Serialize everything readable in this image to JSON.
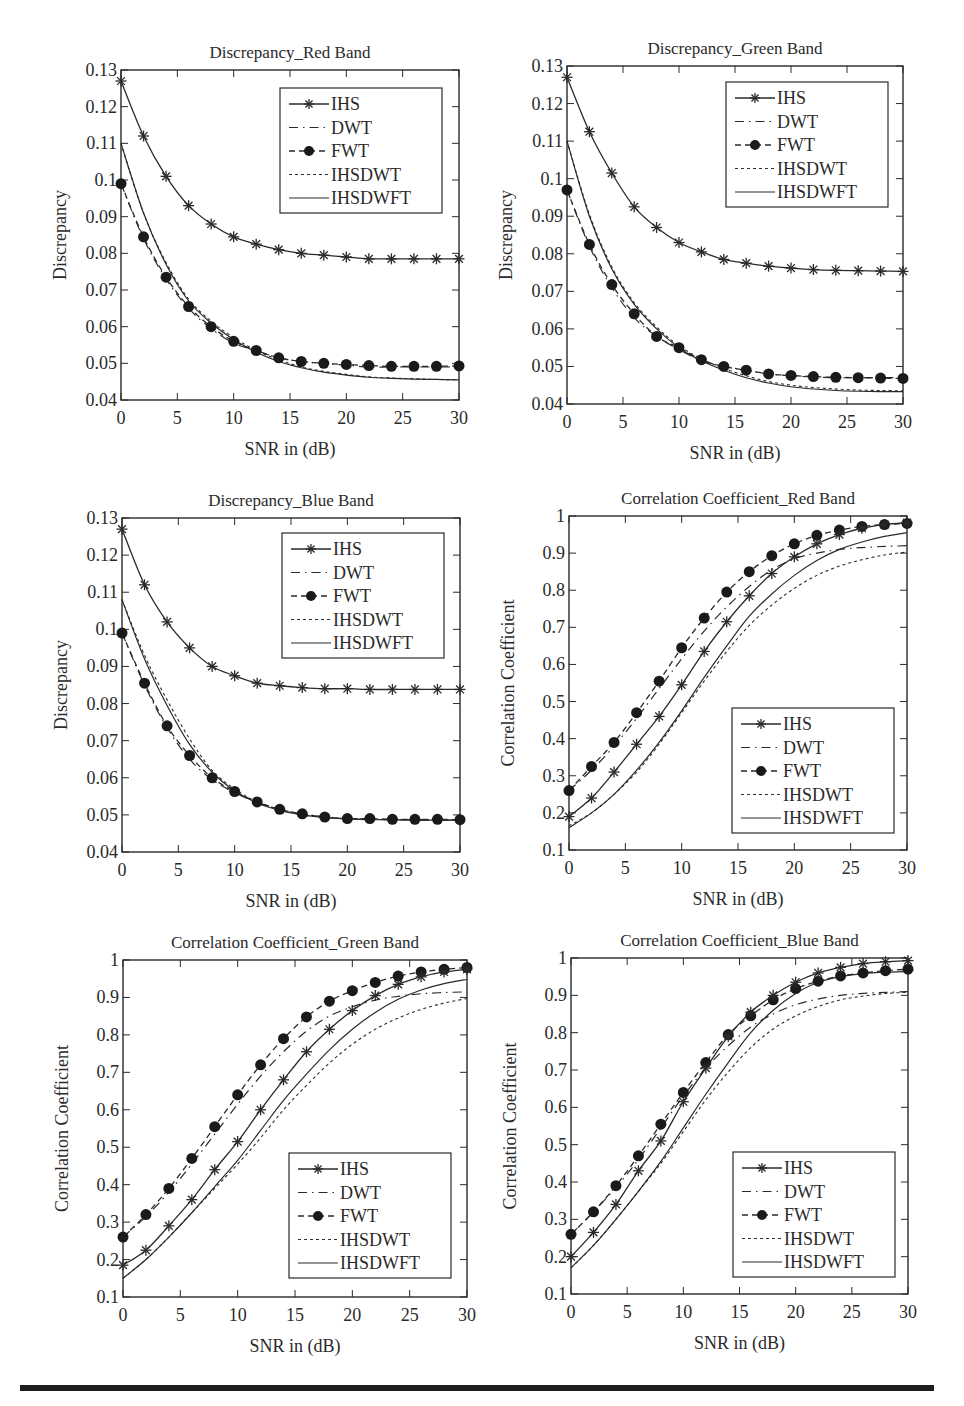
{
  "figure": {
    "layout": "3 rows x 2 columns",
    "bottom_rule": true
  },
  "legend_entries": [
    {
      "name": "IHS",
      "line": "solid",
      "marker": "asterisk"
    },
    {
      "name": "DWT",
      "line": "dash-dot long",
      "marker": "none"
    },
    {
      "name": "FWT",
      "line": "dashed",
      "marker": "filled-circle"
    },
    {
      "name": "IHSDWT",
      "line": "dotted short-dash",
      "marker": "none"
    },
    {
      "name": "IHSDWFT",
      "line": "solid",
      "marker": "none"
    }
  ],
  "chart_data": [
    {
      "id": "disc_red",
      "type": "line",
      "title": "Discrepancy_Red Band",
      "xlabel": "SNR in (dB)",
      "ylabel": "Discrepancy",
      "xlim": [
        0,
        30
      ],
      "ylim": [
        0.04,
        0.13
      ],
      "xticks": [
        0,
        5,
        10,
        15,
        20,
        25,
        30
      ],
      "yticks": [
        0.04,
        0.05,
        0.06,
        0.07,
        0.08,
        0.09,
        0.1,
        0.11,
        0.12,
        0.13
      ],
      "ytick_labels": [
        "0.04",
        "0.05",
        "0.06",
        "0.07",
        "0.08",
        "0.09",
        "0.1",
        "0.11",
        "0.12",
        "0.13"
      ],
      "grid": false,
      "legend_position": "upper right",
      "x": [
        0,
        2,
        4,
        6,
        8,
        10,
        12,
        14,
        16,
        18,
        20,
        22,
        24,
        26,
        28,
        30
      ],
      "series": [
        {
          "name": "IHS",
          "values": [
            0.127,
            0.112,
            0.101,
            0.093,
            0.088,
            0.0845,
            0.0825,
            0.081,
            0.08,
            0.0795,
            0.079,
            0.0785,
            0.0785,
            0.0785,
            0.0785,
            0.0785
          ]
        },
        {
          "name": "DWT",
          "values": [
            0.099,
            0.084,
            0.073,
            0.065,
            0.0595,
            0.0555,
            0.0535,
            0.0515,
            0.0505,
            0.05,
            0.0495,
            0.049,
            0.049,
            0.049,
            0.049,
            0.049
          ]
        },
        {
          "name": "FWT",
          "values": [
            0.099,
            0.0845,
            0.0735,
            0.0655,
            0.06,
            0.056,
            0.0535,
            0.0515,
            0.0505,
            0.05,
            0.0497,
            0.0494,
            0.0492,
            0.0492,
            0.0492,
            0.0493
          ]
        },
        {
          "name": "IHSDWT",
          "values": [
            0.11,
            0.091,
            0.0775,
            0.0675,
            0.0615,
            0.057,
            0.0535,
            0.051,
            0.049,
            0.0478,
            0.047,
            0.0463,
            0.046,
            0.0458,
            0.0456,
            0.0455
          ]
        },
        {
          "name": "IHSDWFT",
          "values": [
            0.11,
            0.091,
            0.077,
            0.067,
            0.061,
            0.0565,
            0.053,
            0.0505,
            0.0488,
            0.0476,
            0.0468,
            0.0462,
            0.0459,
            0.0457,
            0.0456,
            0.0455
          ]
        }
      ]
    },
    {
      "id": "disc_green",
      "type": "line",
      "title": "Discrepancy_Green Band",
      "xlabel": "SNR in (dB)",
      "ylabel": "Discrepancy",
      "xlim": [
        0,
        30
      ],
      "ylim": [
        0.04,
        0.13
      ],
      "xticks": [
        0,
        5,
        10,
        15,
        20,
        25,
        30
      ],
      "yticks": [
        0.04,
        0.05,
        0.06,
        0.07,
        0.08,
        0.09,
        0.1,
        0.11,
        0.12,
        0.13
      ],
      "ytick_labels": [
        "0.04",
        "0.05",
        "0.06",
        "0.07",
        "0.08",
        "0.09",
        "0.1",
        "0.11",
        "0.12",
        "0.13"
      ],
      "grid": false,
      "legend_position": "upper right",
      "x": [
        0,
        2,
        4,
        6,
        8,
        10,
        12,
        14,
        16,
        18,
        20,
        22,
        24,
        26,
        28,
        30
      ],
      "series": [
        {
          "name": "IHS",
          "values": [
            0.127,
            0.1125,
            0.1015,
            0.0925,
            0.087,
            0.083,
            0.0805,
            0.0785,
            0.0775,
            0.0767,
            0.0762,
            0.0758,
            0.0756,
            0.0755,
            0.0754,
            0.0753
          ]
        },
        {
          "name": "DWT",
          "values": [
            0.097,
            0.082,
            0.071,
            0.063,
            0.058,
            0.0545,
            0.0515,
            0.05,
            0.049,
            0.048,
            0.0475,
            0.0472,
            0.047,
            0.047,
            0.047,
            0.047
          ]
        },
        {
          "name": "FWT",
          "values": [
            0.097,
            0.0825,
            0.0718,
            0.064,
            0.058,
            0.055,
            0.0518,
            0.05,
            0.049,
            0.048,
            0.0476,
            0.0473,
            0.0471,
            0.047,
            0.0469,
            0.0468
          ]
        },
        {
          "name": "IHSDWT",
          "values": [
            0.11,
            0.0905,
            0.0765,
            0.067,
            0.0605,
            0.0555,
            0.052,
            0.0495,
            0.0475,
            0.046,
            0.045,
            0.0444,
            0.044,
            0.0437,
            0.0436,
            0.0435
          ]
        },
        {
          "name": "IHSDWFT",
          "values": [
            0.11,
            0.09,
            0.076,
            0.0665,
            0.06,
            0.055,
            0.0515,
            0.049,
            0.047,
            0.0456,
            0.0446,
            0.044,
            0.0436,
            0.0434,
            0.0433,
            0.0433
          ]
        }
      ]
    },
    {
      "id": "disc_blue",
      "type": "line",
      "title": "Discrepancy_Blue Band",
      "xlabel": "SNR in (dB)",
      "ylabel": "Discrepancy",
      "xlim": [
        0,
        30
      ],
      "ylim": [
        0.04,
        0.13
      ],
      "xticks": [
        0,
        5,
        10,
        15,
        20,
        25,
        30
      ],
      "yticks": [
        0.04,
        0.05,
        0.06,
        0.07,
        0.08,
        0.09,
        0.1,
        0.11,
        0.12,
        0.13
      ],
      "ytick_labels": [
        "0.04",
        "0.05",
        "0.06",
        "0.07",
        "0.08",
        "0.09",
        "0.1",
        "0.11",
        "0.12",
        "0.13"
      ],
      "grid": false,
      "legend_position": "upper right",
      "x": [
        0,
        2,
        4,
        6,
        8,
        10,
        12,
        14,
        16,
        18,
        20,
        22,
        24,
        26,
        28,
        30
      ],
      "series": [
        {
          "name": "IHS",
          "values": [
            0.127,
            0.112,
            0.102,
            0.095,
            0.09,
            0.0875,
            0.0855,
            0.0848,
            0.0843,
            0.084,
            0.084,
            0.0838,
            0.0838,
            0.0838,
            0.0838,
            0.0838
          ]
        },
        {
          "name": "DWT",
          "values": [
            0.099,
            0.085,
            0.0735,
            0.065,
            0.0595,
            0.056,
            0.0533,
            0.0515,
            0.0503,
            0.0495,
            0.049,
            0.0488,
            0.0487,
            0.0486,
            0.0486,
            0.0486
          ]
        },
        {
          "name": "FWT",
          "values": [
            0.099,
            0.0855,
            0.074,
            0.066,
            0.06,
            0.0563,
            0.0535,
            0.0515,
            0.0503,
            0.0494,
            0.049,
            0.049,
            0.0488,
            0.0488,
            0.0488,
            0.0487
          ]
        },
        {
          "name": "IHSDWT",
          "values": [
            0.108,
            0.093,
            0.081,
            0.0705,
            0.062,
            0.057,
            0.0535,
            0.0515,
            0.05,
            0.0493,
            0.049,
            0.0488,
            0.0487,
            0.0487,
            0.0486,
            0.0486
          ]
        },
        {
          "name": "IHSDWFT",
          "values": [
            0.108,
            0.092,
            0.0795,
            0.069,
            0.0615,
            0.0565,
            0.0532,
            0.0512,
            0.05,
            0.0493,
            0.0489,
            0.0487,
            0.0487,
            0.0486,
            0.0486,
            0.0486
          ]
        }
      ]
    },
    {
      "id": "cc_red",
      "type": "line",
      "title": "Correlation Coefficient_Red Band",
      "xlabel": "SNR in (dB)",
      "ylabel": "Correlation Coefficient",
      "xlim": [
        0,
        30
      ],
      "ylim": [
        0.1,
        1.0
      ],
      "xticks": [
        0,
        5,
        10,
        15,
        20,
        25,
        30
      ],
      "yticks": [
        0.1,
        0.2,
        0.3,
        0.4,
        0.5,
        0.6,
        0.7,
        0.8,
        0.9,
        1.0
      ],
      "ytick_labels": [
        "0.1",
        "0.2",
        "0.3",
        "0.4",
        "0.5",
        "0.6",
        "0.7",
        "0.8",
        "0.9",
        "1"
      ],
      "grid": false,
      "legend_position": "lower right",
      "x": [
        0,
        2,
        4,
        6,
        8,
        10,
        12,
        14,
        16,
        18,
        20,
        22,
        24,
        26,
        28,
        30
      ],
      "series": [
        {
          "name": "IHS",
          "values": [
            0.19,
            0.24,
            0.31,
            0.385,
            0.46,
            0.545,
            0.635,
            0.715,
            0.785,
            0.845,
            0.89,
            0.925,
            0.95,
            0.967,
            0.977,
            0.982
          ]
        },
        {
          "name": "DWT",
          "values": [
            0.26,
            0.315,
            0.38,
            0.455,
            0.535,
            0.615,
            0.69,
            0.755,
            0.81,
            0.855,
            0.885,
            0.9,
            0.91,
            0.915,
            0.918,
            0.92
          ]
        },
        {
          "name": "FWT",
          "values": [
            0.26,
            0.325,
            0.39,
            0.47,
            0.555,
            0.645,
            0.725,
            0.795,
            0.85,
            0.893,
            0.925,
            0.948,
            0.962,
            0.972,
            0.977,
            0.98
          ]
        },
        {
          "name": "IHSDWT",
          "values": [
            0.165,
            0.2,
            0.25,
            0.31,
            0.385,
            0.47,
            0.555,
            0.635,
            0.705,
            0.76,
            0.805,
            0.84,
            0.865,
            0.882,
            0.895,
            0.903
          ]
        },
        {
          "name": "IHSDWFT",
          "values": [
            0.16,
            0.2,
            0.25,
            0.315,
            0.39,
            0.475,
            0.565,
            0.65,
            0.73,
            0.79,
            0.84,
            0.88,
            0.91,
            0.93,
            0.945,
            0.955
          ]
        }
      ]
    },
    {
      "id": "cc_green",
      "type": "line",
      "title": "Correlation Coefficient_Green Band",
      "xlabel": "SNR in (dB)",
      "ylabel": "Correlation Coefficient",
      "xlim": [
        0,
        30
      ],
      "ylim": [
        0.1,
        1.0
      ],
      "xticks": [
        0,
        5,
        10,
        15,
        20,
        25,
        30
      ],
      "yticks": [
        0.1,
        0.2,
        0.3,
        0.4,
        0.5,
        0.6,
        0.7,
        0.8,
        0.9,
        1.0
      ],
      "ytick_labels": [
        "0.1",
        "0.2",
        "0.3",
        "0.4",
        "0.5",
        "0.6",
        "0.7",
        "0.8",
        "0.9",
        "1"
      ],
      "grid": false,
      "legend_position": "lower right",
      "x": [
        0,
        2,
        4,
        6,
        8,
        10,
        12,
        14,
        16,
        18,
        20,
        22,
        24,
        26,
        28,
        30
      ],
      "series": [
        {
          "name": "IHS",
          "values": [
            0.185,
            0.225,
            0.29,
            0.36,
            0.44,
            0.515,
            0.6,
            0.68,
            0.755,
            0.815,
            0.865,
            0.905,
            0.935,
            0.955,
            0.968,
            0.975
          ]
        },
        {
          "name": "DWT",
          "values": [
            0.26,
            0.315,
            0.38,
            0.455,
            0.535,
            0.615,
            0.69,
            0.755,
            0.81,
            0.85,
            0.875,
            0.893,
            0.903,
            0.91,
            0.913,
            0.915
          ]
        },
        {
          "name": "FWT",
          "values": [
            0.26,
            0.32,
            0.39,
            0.47,
            0.555,
            0.64,
            0.72,
            0.79,
            0.848,
            0.89,
            0.918,
            0.94,
            0.957,
            0.968,
            0.975,
            0.98
          ]
        },
        {
          "name": "IHSDWT",
          "values": [
            0.15,
            0.2,
            0.26,
            0.325,
            0.39,
            0.455,
            0.525,
            0.6,
            0.665,
            0.725,
            0.775,
            0.815,
            0.845,
            0.868,
            0.885,
            0.897
          ]
        },
        {
          "name": "IHSDWFT",
          "values": [
            0.15,
            0.2,
            0.26,
            0.325,
            0.395,
            0.465,
            0.545,
            0.625,
            0.695,
            0.76,
            0.815,
            0.86,
            0.895,
            0.92,
            0.937,
            0.948
          ]
        }
      ]
    },
    {
      "id": "cc_blue",
      "type": "line",
      "title": "Correlation Coefficient_Blue Band",
      "xlabel": "SNR in (dB)",
      "ylabel": "Correlation Coefficient",
      "xlim": [
        0,
        30
      ],
      "ylim": [
        0.1,
        1.0
      ],
      "xticks": [
        0,
        5,
        10,
        15,
        20,
        25,
        30
      ],
      "yticks": [
        0.1,
        0.2,
        0.3,
        0.4,
        0.5,
        0.6,
        0.7,
        0.8,
        0.9,
        1.0
      ],
      "ytick_labels": [
        "0.1",
        "0.2",
        "0.3",
        "0.4",
        "0.5",
        "0.6",
        "0.7",
        "0.8",
        "0.9",
        "1"
      ],
      "grid": false,
      "legend_position": "lower right",
      "x": [
        0,
        2,
        4,
        6,
        8,
        10,
        12,
        14,
        16,
        18,
        20,
        22,
        24,
        26,
        28,
        30
      ],
      "series": [
        {
          "name": "IHS",
          "values": [
            0.2,
            0.265,
            0.34,
            0.43,
            0.51,
            0.615,
            0.705,
            0.79,
            0.855,
            0.9,
            0.935,
            0.96,
            0.975,
            0.985,
            0.99,
            0.993
          ]
        },
        {
          "name": "DWT",
          "values": [
            0.26,
            0.32,
            0.385,
            0.46,
            0.545,
            0.63,
            0.705,
            0.765,
            0.815,
            0.85,
            0.875,
            0.89,
            0.9,
            0.905,
            0.908,
            0.91
          ]
        },
        {
          "name": "FWT",
          "values": [
            0.26,
            0.32,
            0.39,
            0.47,
            0.555,
            0.64,
            0.72,
            0.795,
            0.845,
            0.888,
            0.918,
            0.938,
            0.952,
            0.96,
            0.966,
            0.97
          ]
        },
        {
          "name": "IHSDWT",
          "values": [
            0.17,
            0.23,
            0.3,
            0.375,
            0.45,
            0.535,
            0.62,
            0.695,
            0.76,
            0.81,
            0.845,
            0.87,
            0.888,
            0.898,
            0.905,
            0.908
          ]
        },
        {
          "name": "IHSDWFT",
          "values": [
            0.17,
            0.23,
            0.3,
            0.375,
            0.455,
            0.545,
            0.635,
            0.72,
            0.8,
            0.86,
            0.905,
            0.935,
            0.95,
            0.958,
            0.962,
            0.964
          ]
        }
      ]
    }
  ]
}
